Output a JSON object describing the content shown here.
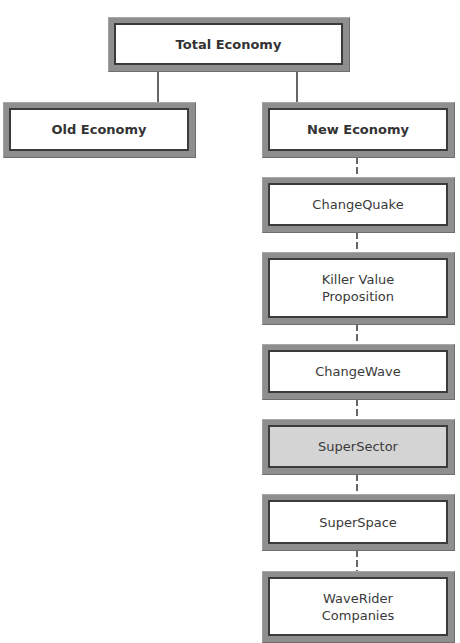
{
  "diagram": {
    "type": "hierarchy",
    "root": {
      "label": "Total Economy"
    },
    "branches": [
      {
        "label": "Old Economy"
      },
      {
        "label": "New Economy"
      }
    ],
    "chain": [
      {
        "label": "ChangeQuake"
      },
      {
        "label": "Killer Value\nProposition"
      },
      {
        "label": "ChangeWave"
      },
      {
        "label": "SuperSector",
        "highlighted": true
      },
      {
        "label": "SuperSpace"
      },
      {
        "label": "WaveRider\nCompanies"
      }
    ],
    "connectors": {
      "root_to_branches": "solid",
      "chain": "dashed"
    },
    "colors": {
      "frame": "#8e8e8e",
      "inner_border": "#3b3b3b",
      "highlight_fill": "#d4d4d4",
      "box_fill": "#ffffff"
    }
  }
}
